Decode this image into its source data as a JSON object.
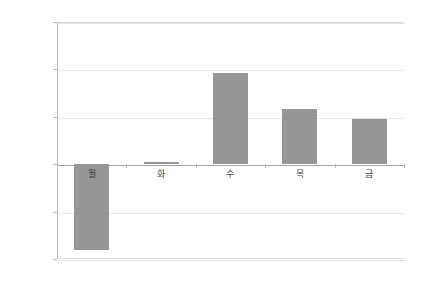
{
  "chart_data": {
    "type": "bar",
    "title": "",
    "xlabel": "",
    "ylabel": "",
    "categories": [
      "월",
      "화",
      "수",
      "목",
      "금"
    ],
    "values": [
      -0.091,
      0.002,
      0.096,
      0.058,
      0.048
    ],
    "value_unit": "%",
    "ylim": [
      -0.1,
      0.15
    ],
    "ytick_values": [
      0.15,
      0.1,
      0.05,
      0.0,
      -0.05,
      -0.1
    ],
    "ytick_labels": [
      "0.150%",
      "0.100%",
      "0.050%",
      "0.00%",
      "-0.050%",
      "-0.100%"
    ],
    "grid": true,
    "legend": "none",
    "bar_color": "#969696",
    "gridline_color": "#e6e6e6",
    "axis_color": "#b8b8b8",
    "zero_line_color": "#a6a6a6",
    "background_color": "#ffffff",
    "series": [
      {
        "name": "",
        "values": [
          -0.091,
          0.002,
          0.096,
          0.058,
          0.048
        ]
      }
    ]
  }
}
